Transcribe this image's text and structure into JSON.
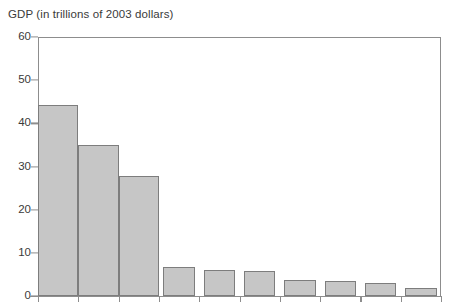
{
  "chart_data": {
    "type": "bar",
    "title": "GDP (in trillions of 2003 dollars)",
    "xlabel": "",
    "ylabel": "GDP (in trillions of 2003 dollars)",
    "categories": [
      "1",
      "2",
      "3",
      "4",
      "5",
      "6",
      "7",
      "8",
      "9",
      "10"
    ],
    "values": [
      44.3,
      35.1,
      27.8,
      6.7,
      6.1,
      5.8,
      3.7,
      3.5,
      3.0,
      1.9
    ],
    "ylim": [
      0,
      60
    ],
    "yticks": [
      0,
      10,
      20,
      30,
      40,
      50,
      60
    ],
    "ytick_labels": [
      "0",
      "10",
      "20",
      "30",
      "40",
      "50",
      "60"
    ],
    "xtick_labels": [],
    "grid": false,
    "legend": false,
    "legend_position": "none",
    "bar_fill_color": "#c6c6c6",
    "bar_edge_color": "#7d7d7d",
    "axis_color": "#8d8d8d",
    "text_color": "#3a3a3a",
    "background_color": "#ffffff",
    "note": "x-axis category labels are cropped out of the visible image"
  },
  "axis": {
    "title": "GDP (in trillions of 2003 dollars)",
    "tick_60": "60",
    "tick_50": "50",
    "tick_40": "40",
    "tick_30": "30",
    "tick_20": "20",
    "tick_10": "10",
    "tick_0": "0"
  }
}
